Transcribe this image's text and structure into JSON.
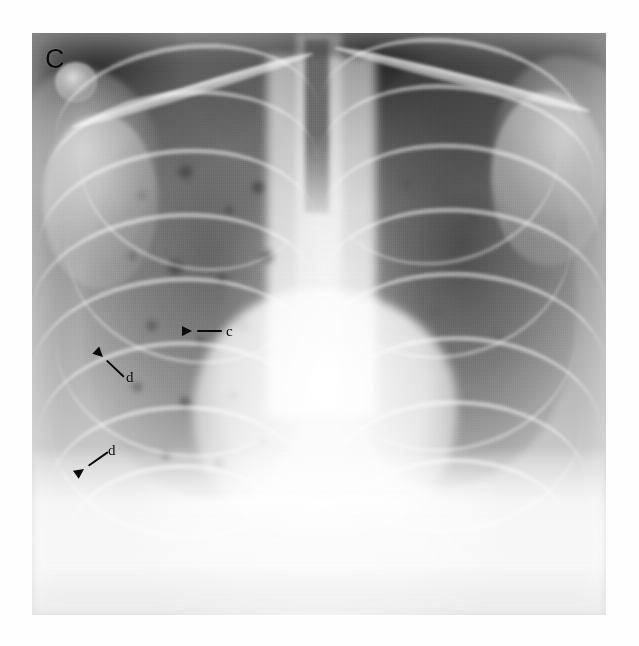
{
  "figure": {
    "panel_letter": "C",
    "modality": "chest-radiograph",
    "view": "frontal-pa",
    "plate": {
      "left": 32,
      "top": 33,
      "width": 574,
      "height": 582,
      "background_color": "#8e8e8e",
      "page_background": "#ffffff"
    }
  },
  "annotations": [
    {
      "id": "annot-c",
      "label": "c",
      "direction": "left",
      "tip_x": 192,
      "tip_y": 331,
      "tail_x": 222,
      "tail_y": 331,
      "label_x": 226,
      "label_y": 324,
      "color": "#0a0a0a"
    },
    {
      "id": "annot-d-upper",
      "label": "d",
      "direction": "up-left",
      "tip_x": 103,
      "tip_y": 357,
      "tail_x": 124,
      "tail_y": 377,
      "label_x": 126,
      "label_y": 370,
      "color": "#0a0a0a"
    },
    {
      "id": "annot-d-lower",
      "label": "d",
      "direction": "down-left",
      "tip_x": 84,
      "tip_y": 469,
      "tail_x": 108,
      "tail_y": 452,
      "label_x": 108,
      "label_y": 443,
      "color": "#0a0a0a"
    }
  ],
  "anatomy": {
    "regions": [
      "right-lung-field",
      "left-lung-field",
      "mediastinum",
      "cardiac-silhouette",
      "diaphragm",
      "trachea",
      "thoracic-spine",
      "right-clavicle",
      "left-clavicle",
      "right-humeral-head",
      "posterior-ribs",
      "anterior-ribs"
    ]
  }
}
